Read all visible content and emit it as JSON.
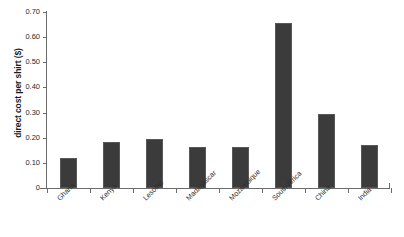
{
  "chart_data": {
    "type": "bar",
    "title": "",
    "xlabel": "",
    "ylabel": "direct cost per shirt ($)",
    "categories": [
      "Ghana",
      "Kenya",
      "Lesotho",
      "Madagascar",
      "Mozambique",
      "South Africa",
      "China",
      "India"
    ],
    "values": [
      0.12,
      0.184,
      0.196,
      0.164,
      0.164,
      0.655,
      0.293,
      0.172
    ],
    "ylim": [
      0,
      0.7
    ],
    "ytick_labels": [
      "0.70",
      "0.60",
      "0.50",
      "0.40",
      "0.30",
      "0.20",
      "0.10",
      "0"
    ],
    "ytick_values": [
      0.7,
      0.6,
      0.5,
      0.4,
      0.3,
      0.2,
      0.1,
      0
    ],
    "grid": false,
    "legend": false,
    "bar_color": "#3b3b3b",
    "axis_color": "#6b6b6b",
    "background": "#ffffff"
  }
}
